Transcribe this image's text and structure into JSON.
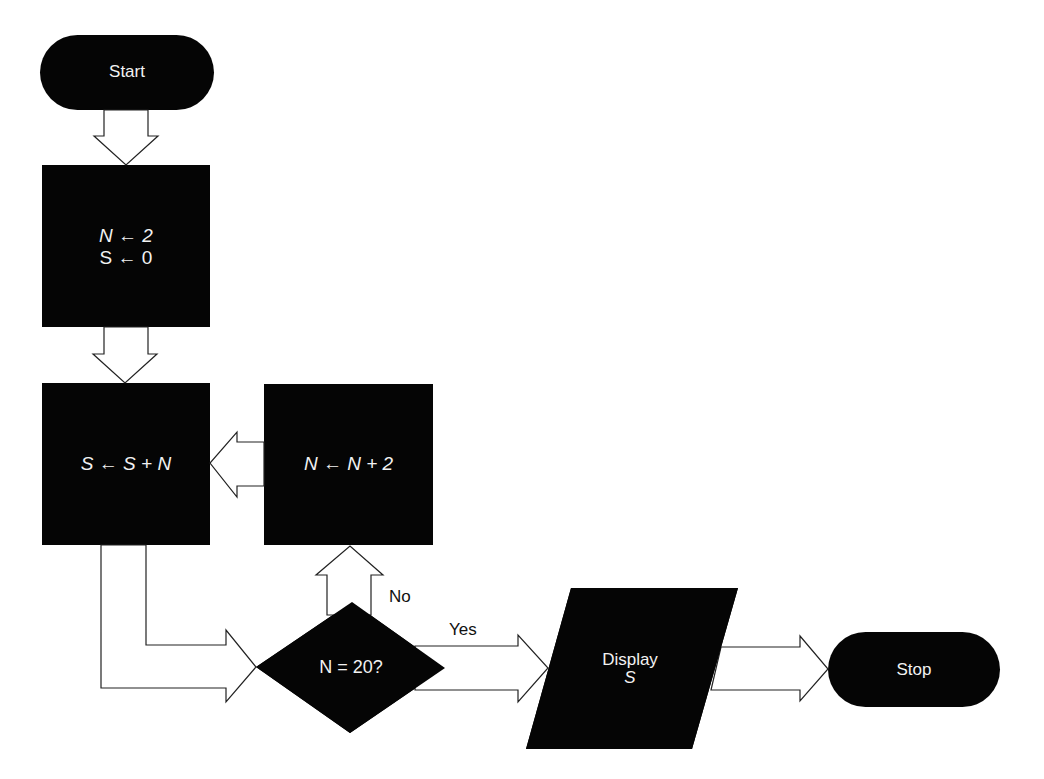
{
  "diagram": {
    "type": "flowchart",
    "colors": {
      "shape_fill": "#050505",
      "shape_text": "#f2f2f2",
      "arrow_outline": "#222222",
      "background": "#ffffff"
    },
    "nodes": {
      "start": {
        "shape": "terminator",
        "label": "Start"
      },
      "init": {
        "shape": "process",
        "line1": "N ← 2",
        "line2": "S ← 0"
      },
      "accumulate": {
        "shape": "process",
        "label": "S ← S + N"
      },
      "increment": {
        "shape": "process",
        "label": "N ← N + 2"
      },
      "decision": {
        "shape": "decision",
        "label": "N = 20?"
      },
      "display": {
        "shape": "input-output",
        "line1": "Display",
        "line2": "S"
      },
      "stop": {
        "shape": "terminator",
        "label": "Stop"
      }
    },
    "edge_labels": {
      "no": "No",
      "yes": "Yes"
    },
    "edges": [
      {
        "from": "start",
        "to": "init"
      },
      {
        "from": "init",
        "to": "accumulate"
      },
      {
        "from": "accumulate",
        "to": "decision"
      },
      {
        "from": "decision",
        "to": "increment",
        "label": "No"
      },
      {
        "from": "increment",
        "to": "accumulate"
      },
      {
        "from": "decision",
        "to": "display",
        "label": "Yes"
      },
      {
        "from": "display",
        "to": "stop"
      }
    ]
  }
}
